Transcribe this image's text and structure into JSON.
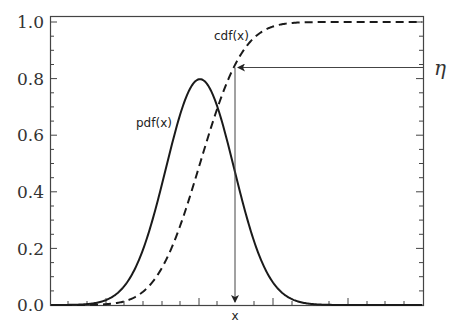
{
  "chart_data": {
    "type": "line",
    "title": "",
    "xlabel": "",
    "ylabel": "",
    "ylim": [
      0.0,
      1.0
    ],
    "y_ticks": [
      "0.0",
      "0.2",
      "0.4",
      "0.6",
      "0.8",
      "1.0"
    ],
    "x_ticks_labeled": false,
    "grid": false,
    "legend": "none (inline curve labels)",
    "series": [
      {
        "name": "pdf(x)",
        "style": "solid",
        "description": "Gaussian density, mean mu, sigma 0.5, peak ~0.80",
        "x_sigma": [
          -4,
          -3,
          -2,
          -1.5,
          -1,
          -0.5,
          0,
          0.5,
          1,
          1.5,
          2,
          3,
          4
        ],
        "values": [
          0.0001,
          0.0089,
          0.108,
          0.259,
          0.484,
          0.704,
          0.798,
          0.704,
          0.484,
          0.259,
          0.108,
          0.0089,
          0.0001
        ]
      },
      {
        "name": "cdf(x)",
        "style": "dashed",
        "description": "Gaussian cumulative distribution, same mean",
        "x_sigma": [
          -4,
          -3,
          -2,
          -1.5,
          -1,
          -0.5,
          0,
          0.5,
          1,
          1.5,
          2,
          3,
          4
        ],
        "values": [
          0.0,
          0.001,
          0.023,
          0.067,
          0.159,
          0.309,
          0.5,
          0.691,
          0.841,
          0.933,
          0.977,
          0.999,
          1.0
        ]
      }
    ],
    "annotations": [
      {
        "text": "pdf(x)",
        "target": "pdf curve"
      },
      {
        "text": "cdf(x)",
        "target": "cdf curve"
      },
      {
        "text": "η",
        "description": "horizontal arrow from right axis at eta ≈ 0.84 pointing to cdf curve"
      },
      {
        "text": "x",
        "description": "vertical arrow from cdf intersection down to x-axis at mean + 1 sigma"
      }
    ],
    "eta_value": 0.84
  },
  "labels": {
    "pdf": "pdf(x)",
    "cdf": "cdf(x)",
    "eta": "η",
    "x": "x",
    "y0": "0.0",
    "y1": "0.2",
    "y2": "0.4",
    "y3": "0.6",
    "y4": "0.8",
    "y5": "1.0"
  }
}
